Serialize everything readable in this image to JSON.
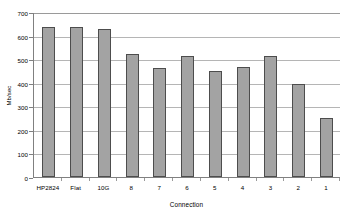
{
  "chart_data": {
    "type": "bar",
    "title": "",
    "subtitle": "",
    "xlabel": "Connection",
    "ylabel": "Mb/sec",
    "categories": [
      "HP2824",
      "Flat",
      "10G",
      "8",
      "7",
      "6",
      "5",
      "4",
      "3",
      "2",
      "1"
    ],
    "values": [
      637,
      636,
      630,
      520,
      463,
      513,
      450,
      465,
      513,
      395,
      251
    ],
    "series": [
      {
        "name": "Throughput",
        "values": [
          637,
          636,
          630,
          520,
          463,
          513,
          450,
          465,
          513,
          395,
          251
        ]
      }
    ],
    "ylim": [
      0,
      700
    ],
    "ytick_labels": [
      "700",
      "600",
      "500",
      "400",
      "300",
      "200",
      "100",
      "0"
    ],
    "ytick_values": [
      700,
      600,
      500,
      400,
      300,
      200,
      100,
      0
    ],
    "grid": true,
    "grid_axis": "y",
    "legend": false,
    "legend_position": "none",
    "bar_fill_color": "#a3a3a3",
    "bar_border_color": "#4d4d4d",
    "gridline_color": "#b5b5b5",
    "axis_color": "#808080",
    "background_color": "#ffffff"
  }
}
